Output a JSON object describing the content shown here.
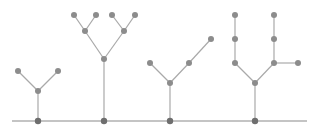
{
  "colors": {
    "background": "#ffffff",
    "edge": "#a9a9a9",
    "node": "#8c8c8c",
    "baseline": "#8a8a8a",
    "root_node": "#6e6e6e"
  },
  "baseline": {
    "x1": 12,
    "x2": 307,
    "y": 121
  },
  "trees": [
    {
      "name": "tree-1",
      "root": [
        38,
        121
      ],
      "edges": [
        [
          [
            38,
            121
          ],
          [
            38,
            91
          ]
        ],
        [
          [
            38,
            91
          ],
          [
            18,
            71
          ]
        ],
        [
          [
            38,
            91
          ],
          [
            58,
            71
          ]
        ]
      ],
      "nodes": [
        [
          38,
          91
        ],
        [
          18,
          71
        ],
        [
          58,
          71
        ]
      ]
    },
    {
      "name": "tree-2",
      "root": [
        104,
        121
      ],
      "edges": [
        [
          [
            104,
            121
          ],
          [
            104,
            59
          ]
        ],
        [
          [
            104,
            59
          ],
          [
            85,
            31
          ]
        ],
        [
          [
            104,
            59
          ],
          [
            124,
            31
          ]
        ],
        [
          [
            85,
            31
          ],
          [
            74,
            15
          ]
        ],
        [
          [
            85,
            31
          ],
          [
            96,
            15
          ]
        ],
        [
          [
            124,
            31
          ],
          [
            112,
            15
          ]
        ],
        [
          [
            124,
            31
          ],
          [
            135,
            15
          ]
        ]
      ],
      "nodes": [
        [
          104,
          59
        ],
        [
          85,
          31
        ],
        [
          124,
          31
        ],
        [
          74,
          15
        ],
        [
          96,
          15
        ],
        [
          112,
          15
        ],
        [
          135,
          15
        ]
      ]
    },
    {
      "name": "tree-3",
      "root": [
        170,
        121
      ],
      "edges": [
        [
          [
            170,
            121
          ],
          [
            170,
            83
          ]
        ],
        [
          [
            170,
            83
          ],
          [
            150,
            63
          ]
        ],
        [
          [
            170,
            83
          ],
          [
            189,
            63
          ]
        ],
        [
          [
            189,
            63
          ],
          [
            211,
            39
          ]
        ]
      ],
      "nodes": [
        [
          170,
          83
        ],
        [
          150,
          63
        ],
        [
          189,
          63
        ],
        [
          211,
          39
        ]
      ]
    },
    {
      "name": "tree-4",
      "root": [
        255,
        121
      ],
      "edges": [
        [
          [
            255,
            121
          ],
          [
            255,
            83
          ]
        ],
        [
          [
            255,
            83
          ],
          [
            235,
            63
          ]
        ],
        [
          [
            255,
            83
          ],
          [
            274,
            63
          ]
        ],
        [
          [
            235,
            63
          ],
          [
            235,
            39
          ]
        ],
        [
          [
            235,
            39
          ],
          [
            235,
            15
          ]
        ],
        [
          [
            274,
            63
          ],
          [
            274,
            39
          ]
        ],
        [
          [
            274,
            39
          ],
          [
            274,
            15
          ]
        ],
        [
          [
            274,
            63
          ],
          [
            298,
            63
          ]
        ]
      ],
      "nodes": [
        [
          255,
          83
        ],
        [
          235,
          63
        ],
        [
          235,
          39
        ],
        [
          235,
          15
        ],
        [
          274,
          63
        ],
        [
          274,
          39
        ],
        [
          274,
          15
        ],
        [
          298,
          63
        ]
      ]
    }
  ]
}
